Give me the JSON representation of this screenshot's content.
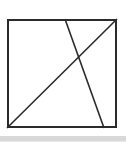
{
  "canvas": {
    "width": 126,
    "height": 145,
    "background": "#ffffff"
  },
  "figure": {
    "name": "square-with-two-crossing-lines",
    "stroke_color": "#2b2b2b",
    "square": {
      "name": "square-outline",
      "x": 7,
      "y": 19,
      "width": 110,
      "height": 109,
      "stroke_width": 2,
      "fill": "none"
    },
    "lines": [
      {
        "name": "diagonal-line-bottomleft-to-topright",
        "x1": 7,
        "y1": 128,
        "x2": 117,
        "y2": 19,
        "stroke_width": 1.6
      },
      {
        "name": "slanted-line-top-to-bottom",
        "x1": 65,
        "y1": 19,
        "x2": 104,
        "y2": 128,
        "stroke_width": 1.6
      }
    ],
    "intersection": {
      "name": "line-intersection-point",
      "x": 72,
      "y": 63
    }
  },
  "artifacts": {
    "bottom_band": {
      "name": "bottom-gray-band",
      "y": 136,
      "height": 5,
      "color": "#d8d8d8"
    },
    "bottom_band_edge": {
      "name": "bottom-gray-band-edge",
      "y": 141,
      "height": 1,
      "color": "#e8e8e8"
    }
  }
}
